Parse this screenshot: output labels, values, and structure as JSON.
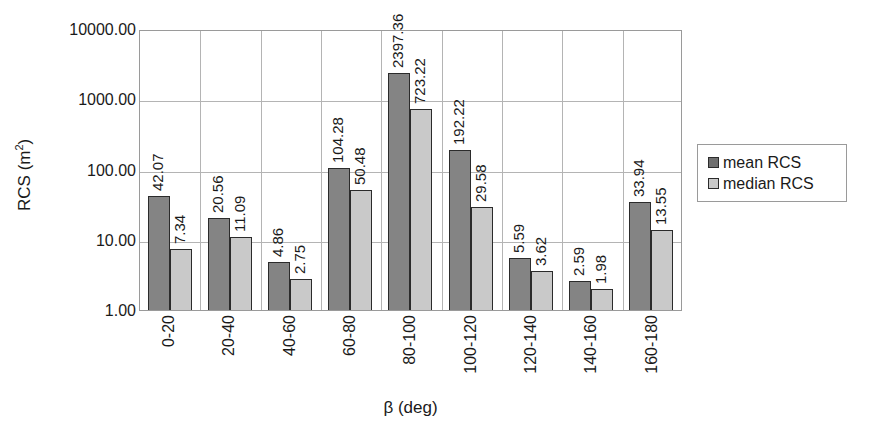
{
  "chart_data": {
    "type": "bar",
    "title": "",
    "subtitle": "",
    "xlabel": "β (deg)",
    "ylabel": "RCS (m²)",
    "ylabel_base": "RCS (m",
    "ylabel_sup": "2",
    "ylabel_tail": ")",
    "yscale": "log",
    "ylim": [
      1.0,
      10000.0
    ],
    "grid": "both",
    "legend_position": "right",
    "categories": [
      "0-20",
      "20-40",
      "40-60",
      "60-80",
      "80-100",
      "100-120",
      "120-140",
      "140-160",
      "160-180"
    ],
    "ytick_labels": [
      "10000.00",
      "1000.00",
      "100.00",
      "10.00",
      "1.00"
    ],
    "ytick_values": [
      10000.0,
      1000.0,
      100.0,
      10.0,
      1.0
    ],
    "series": [
      {
        "name": "mean RCS",
        "color": "#848484",
        "values": [
          42.07,
          20.56,
          4.86,
          104.28,
          2397.36,
          192.22,
          5.59,
          2.59,
          33.94
        ],
        "labels": [
          "42.07",
          "20.56",
          "4.86",
          "104.28",
          "2397.36",
          "192.22",
          "5.59",
          "2.59",
          "33.94"
        ]
      },
      {
        "name": "median RCS",
        "color": "#c9c9c9",
        "values": [
          7.34,
          11.09,
          2.75,
          50.48,
          723.22,
          29.58,
          3.62,
          1.98,
          13.55
        ],
        "labels": [
          "7.34",
          "11.09",
          "2.75",
          "50.48",
          "723.22",
          "29.58",
          "3.62",
          "1.98",
          "13.55"
        ]
      }
    ]
  },
  "legend": {
    "entries": [
      {
        "label": "mean RCS",
        "swatch": "mean"
      },
      {
        "label": "median RCS",
        "swatch": "median"
      }
    ]
  },
  "colors": {
    "mean_bar": "#848484",
    "median_bar": "#c9c9c9",
    "bar_border": "#2b2b2b",
    "gridline": "#b4b4b4",
    "axis": "#9a9a9a",
    "text": "#1a1a1a",
    "background": "#ffffff"
  }
}
